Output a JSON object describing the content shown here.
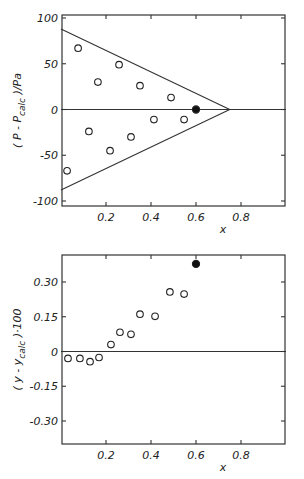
{
  "chart_data": [
    {
      "type": "scatter",
      "title": "",
      "xlabel": "x",
      "ylabel": "(P - P_calc)/Pa",
      "ylabel_parts": {
        "open": "( P - P",
        "sub": "calc",
        "close": " )/Pa"
      },
      "xlim": [
        0,
        1.0
      ],
      "ylim": [
        -105,
        105
      ],
      "xticks": [
        0.2,
        0.4,
        0.6,
        0.8
      ],
      "xtick_labels": [
        "0.2",
        "0.4",
        "0.6",
        "0.8"
      ],
      "yticks": [
        100,
        50,
        0,
        -50,
        -100
      ],
      "ytick_labels": [
        "100",
        "50",
        "0",
        "-50",
        "-100"
      ],
      "grid": false,
      "legend": null,
      "series": [
        {
          "name": "open-points",
          "marker": "open-circle",
          "x": [
            0.076,
            0.164,
            0.258,
            0.351,
            0.489,
            0.027,
            0.124,
            0.218,
            0.311,
            0.413,
            0.547
          ],
          "y": [
            67,
            30,
            49,
            26,
            13,
            -67,
            -24,
            -45,
            -30,
            -11,
            -11
          ]
        },
        {
          "name": "filled-point",
          "marker": "filled-circle",
          "x": [
            0.6
          ],
          "y": [
            0
          ]
        }
      ],
      "lines": [
        {
          "name": "zero-line",
          "x": [
            0,
            1.0
          ],
          "y": [
            0,
            0
          ]
        },
        {
          "name": "upper-bound",
          "x": [
            0,
            0.75
          ],
          "y": [
            88,
            0
          ]
        },
        {
          "name": "lower-bound",
          "x": [
            0,
            0.75
          ],
          "y": [
            -88,
            0
          ]
        }
      ]
    },
    {
      "type": "scatter",
      "title": "",
      "xlabel": "x",
      "ylabel": "(y - y_calc)·100",
      "ylabel_parts": {
        "open": "( y - y",
        "sub": "calc",
        "close": " )·100"
      },
      "xlim": [
        0,
        1.0
      ],
      "ylim": [
        -0.4,
        0.4
      ],
      "xticks": [
        0.2,
        0.4,
        0.6,
        0.8
      ],
      "xtick_labels": [
        "0.2",
        "0.4",
        "0.6",
        "0.8"
      ],
      "yticks": [
        0.3,
        0.15,
        0,
        -0.15,
        -0.3
      ],
      "ytick_labels": [
        "0.30",
        "0.15",
        "0",
        "-0.15",
        "-0.30"
      ],
      "grid": false,
      "legend": null,
      "series": [
        {
          "name": "open-points",
          "marker": "open-circle",
          "x": [
            0.031,
            0.084,
            0.129,
            0.169,
            0.222,
            0.262,
            0.311,
            0.351,
            0.418,
            0.484,
            0.547
          ],
          "y": [
            -0.03,
            -0.03,
            -0.044,
            -0.026,
            0.03,
            0.083,
            0.074,
            0.161,
            0.152,
            0.257,
            0.248
          ]
        },
        {
          "name": "filled-point",
          "marker": "filled-circle",
          "x": [
            0.6
          ],
          "y": [
            0.378
          ]
        }
      ],
      "lines": [
        {
          "name": "zero-line",
          "x": [
            0,
            1.0
          ],
          "y": [
            0,
            0
          ]
        }
      ]
    }
  ],
  "layout": {
    "panels": [
      {
        "left": 62,
        "right": 285,
        "top": 15,
        "bottom": 206,
        "x0px": 61,
        "x1px": 286,
        "yTopVal": 100,
        "yTopPx": 18,
        "yBotVal": -100,
        "yBotPx": 201
      },
      {
        "left": 62,
        "right": 285,
        "top": 255,
        "bottom": 444,
        "x0px": 61,
        "x1px": 286,
        "yTopVal": 0.3,
        "yTopPx": 282,
        "yBotVal": -0.3,
        "yBotPx": 421
      }
    ]
  }
}
